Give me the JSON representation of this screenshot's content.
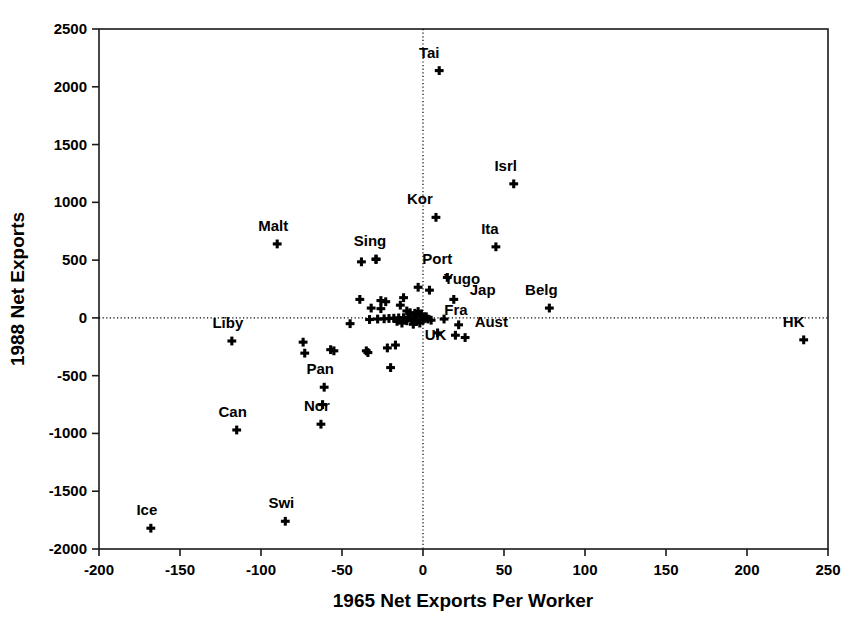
{
  "chart_data": {
    "type": "scatter",
    "title": "",
    "xlabel": "1965 Net Exports Per Worker",
    "ylabel": "1988 Net Exports",
    "xlim": [
      -200,
      250
    ],
    "ylim": [
      -2000,
      2500
    ],
    "xticks": [
      -200,
      -150,
      -100,
      -50,
      0,
      50,
      100,
      150,
      200,
      250
    ],
    "xticklabels": [
      "-200",
      "-150",
      "-100",
      "-50",
      "0",
      "50",
      "100",
      "150",
      "200",
      "250"
    ],
    "yticks": [
      -2000,
      -1500,
      -1000,
      -500,
      0,
      500,
      1000,
      1500,
      2000,
      2500
    ],
    "yticklabels": [
      "-2000",
      "-1500",
      "-1000",
      "-500",
      "0",
      "500",
      "1000",
      "1500",
      "2000",
      "2500"
    ],
    "grid": false,
    "reference_lines": {
      "x": 0,
      "y": 0,
      "style": "dotted"
    },
    "legend": "none",
    "marker": "plus",
    "labeled_points": [
      {
        "label": "Tai",
        "x": 10,
        "y": 2140,
        "lx": -10,
        "ly": 100
      },
      {
        "label": "Isrl",
        "x": 56,
        "y": 1160,
        "lx": -8,
        "ly": 100
      },
      {
        "label": "Kor",
        "x": 8,
        "y": 870,
        "lx": -16,
        "ly": 100
      },
      {
        "label": "Ita",
        "x": 45,
        "y": 615,
        "lx": -6,
        "ly": 100
      },
      {
        "label": "Malt",
        "x": -90,
        "y": 640,
        "lx": -4,
        "ly": 100
      },
      {
        "label": "Sing",
        "x": -29,
        "y": 510,
        "lx": -6,
        "ly": 100
      },
      {
        "label": "Port",
        "x": 15,
        "y": 350,
        "lx": -10,
        "ly": 100
      },
      {
        "label": "Yugo",
        "x": 4,
        "y": 240,
        "lx": 14,
        "ly": 44
      },
      {
        "label": "Jap",
        "x": 19,
        "y": 160,
        "lx": 16,
        "ly": 36
      },
      {
        "label": "Belg",
        "x": 78,
        "y": 85,
        "lx": -8,
        "ly": 100
      },
      {
        "label": "Fra",
        "x": 2,
        "y": 10,
        "lx": 18,
        "ly": 12
      },
      {
        "label": "Aust",
        "x": 22,
        "y": -60,
        "lx": 16,
        "ly": -16
      },
      {
        "label": "UK",
        "x": 9,
        "y": -130,
        "lx": -2,
        "ly": -56
      },
      {
        "label": "HK",
        "x": 235,
        "y": -190,
        "lx": -10,
        "ly": 100
      },
      {
        "label": "Liby",
        "x": -118,
        "y": -200,
        "lx": -4,
        "ly": 100
      },
      {
        "label": "Pan",
        "x": -61,
        "y": -600,
        "lx": -4,
        "ly": 100
      },
      {
        "label": "Nor",
        "x": -63,
        "y": -920,
        "lx": -4,
        "ly": 100
      },
      {
        "label": "Can",
        "x": -115,
        "y": -970,
        "lx": -4,
        "ly": 100
      },
      {
        "label": "Swi",
        "x": -85,
        "y": -1760,
        "lx": -4,
        "ly": 100
      },
      {
        "label": "Ice",
        "x": -168,
        "y": -1820,
        "lx": -4,
        "ly": 100
      }
    ],
    "unlabeled_points": [
      {
        "x": -38,
        "y": 485
      },
      {
        "x": -29,
        "y": 505
      },
      {
        "x": -3,
        "y": 265
      },
      {
        "x": -12,
        "y": 175
      },
      {
        "x": -39,
        "y": 160
      },
      {
        "x": -26,
        "y": 150
      },
      {
        "x": -23,
        "y": 140
      },
      {
        "x": -32,
        "y": 85
      },
      {
        "x": -26,
        "y": 80
      },
      {
        "x": -14,
        "y": 110
      },
      {
        "x": -10,
        "y": 60
      },
      {
        "x": -8,
        "y": 45
      },
      {
        "x": -5,
        "y": 40
      },
      {
        "x": -3,
        "y": 55
      },
      {
        "x": -1,
        "y": 35
      },
      {
        "x": -2,
        "y": 20
      },
      {
        "x": -4,
        "y": 15
      },
      {
        "x": -6,
        "y": 8
      },
      {
        "x": -9,
        "y": 5
      },
      {
        "x": -12,
        "y": 2
      },
      {
        "x": -15,
        "y": 0
      },
      {
        "x": -18,
        "y": -3
      },
      {
        "x": -21,
        "y": -5
      },
      {
        "x": -24,
        "y": -8
      },
      {
        "x": -28,
        "y": -10
      },
      {
        "x": -33,
        "y": -14
      },
      {
        "x": -45,
        "y": -50
      },
      {
        "x": -16,
        "y": -30
      },
      {
        "x": -13,
        "y": -45
      },
      {
        "x": -10,
        "y": -25
      },
      {
        "x": -7,
        "y": -20
      },
      {
        "x": -4,
        "y": -30
      },
      {
        "x": -2,
        "y": -45
      },
      {
        "x": 0,
        "y": -18
      },
      {
        "x": 1,
        "y": -5
      },
      {
        "x": 3,
        "y": -10
      },
      {
        "x": 5,
        "y": -20
      },
      {
        "x": 13,
        "y": -10
      },
      {
        "x": 20,
        "y": -150
      },
      {
        "x": 26,
        "y": -170
      },
      {
        "x": -74,
        "y": -210
      },
      {
        "x": -73,
        "y": -305
      },
      {
        "x": -57,
        "y": -275
      },
      {
        "x": -55,
        "y": -285
      },
      {
        "x": -35,
        "y": -285
      },
      {
        "x": -34,
        "y": -300
      },
      {
        "x": -22,
        "y": -260
      },
      {
        "x": -17,
        "y": -235
      },
      {
        "x": -20,
        "y": -430
      },
      {
        "x": -62,
        "y": -750
      },
      {
        "x": -6,
        "y": -55
      }
    ]
  },
  "axis": {
    "xlabel": "1965 Net Exports Per Worker",
    "ylabel": "1988 Net Exports"
  }
}
